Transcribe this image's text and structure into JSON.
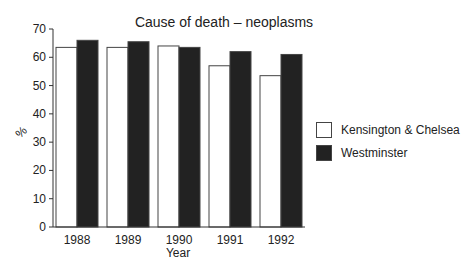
{
  "chart_data": {
    "type": "bar",
    "title": "Cause of death – neoplasms",
    "xlabel": "Year",
    "ylabel": "%",
    "ylim": [
      0,
      70
    ],
    "yticks": [
      0,
      10,
      20,
      30,
      40,
      50,
      60,
      70
    ],
    "categories": [
      "1988",
      "1989",
      "1990",
      "1991",
      "1992"
    ],
    "series": [
      {
        "name": "Kensington & Chelsea",
        "color": "#ffffff",
        "values": [
          63.5,
          63.5,
          64,
          57,
          53.5
        ]
      },
      {
        "name": "Westminster",
        "color": "#222222",
        "values": [
          66,
          65.5,
          63.5,
          62,
          61
        ]
      }
    ],
    "grid": false,
    "legend_position": "right"
  }
}
